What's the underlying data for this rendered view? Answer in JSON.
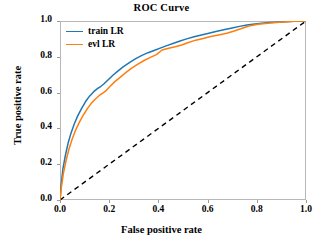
{
  "chart_data": {
    "type": "line",
    "title": "ROC Curve",
    "xlabel": "False positive rate",
    "ylabel": "True positive rate",
    "xlim": [
      0.0,
      1.0
    ],
    "ylim": [
      0.0,
      1.0
    ],
    "xticks": [
      "0.0",
      "0.2",
      "0.4",
      "0.6",
      "0.8",
      "1.0"
    ],
    "xtick_values": [
      0.0,
      0.2,
      0.4,
      0.6,
      0.8,
      1.0
    ],
    "yticks": [
      "0.0",
      "0.2",
      "0.4",
      "0.6",
      "0.8",
      "1.0"
    ],
    "ytick_values": [
      0.0,
      0.2,
      0.4,
      0.6,
      0.8,
      1.0
    ],
    "grid": false,
    "legend_position": "upper left",
    "series": [
      {
        "name": "train LR",
        "color": "#1f77b4",
        "style": "solid",
        "x": [
          0.0,
          0.005,
          0.012,
          0.022,
          0.033,
          0.045,
          0.058,
          0.072,
          0.088,
          0.104,
          0.12,
          0.137,
          0.152,
          0.165,
          0.178,
          0.196,
          0.215,
          0.235,
          0.258,
          0.282,
          0.308,
          0.333,
          0.358,
          0.385,
          0.41,
          0.437,
          0.462,
          0.488,
          0.515,
          0.545,
          0.575,
          0.605,
          0.638,
          0.67,
          0.7,
          0.73,
          0.76,
          0.8,
          0.85,
          0.9,
          0.95,
          1.0
        ],
        "y": [
          0.0,
          0.09,
          0.175,
          0.25,
          0.318,
          0.375,
          0.425,
          0.47,
          0.512,
          0.55,
          0.58,
          0.605,
          0.622,
          0.634,
          0.648,
          0.672,
          0.697,
          0.72,
          0.745,
          0.768,
          0.79,
          0.808,
          0.823,
          0.837,
          0.85,
          0.864,
          0.876,
          0.888,
          0.9,
          0.912,
          0.922,
          0.932,
          0.943,
          0.952,
          0.961,
          0.97,
          0.978,
          0.985,
          0.991,
          0.995,
          0.998,
          1.0
        ]
      },
      {
        "name": "evl LR",
        "color": "#ff7f0e",
        "style": "solid",
        "x": [
          0.0,
          0.006,
          0.014,
          0.025,
          0.037,
          0.05,
          0.064,
          0.079,
          0.095,
          0.112,
          0.128,
          0.145,
          0.16,
          0.172,
          0.185,
          0.203,
          0.222,
          0.243,
          0.266,
          0.29,
          0.315,
          0.34,
          0.365,
          0.392,
          0.415,
          0.442,
          0.468,
          0.495,
          0.522,
          0.552,
          0.582,
          0.612,
          0.645,
          0.678,
          0.708,
          0.738,
          0.768,
          0.805,
          0.855,
          0.905,
          0.952,
          1.0
        ],
        "y": [
          0.0,
          0.075,
          0.15,
          0.222,
          0.288,
          0.342,
          0.392,
          0.435,
          0.475,
          0.512,
          0.542,
          0.566,
          0.584,
          0.596,
          0.608,
          0.634,
          0.66,
          0.684,
          0.71,
          0.735,
          0.758,
          0.778,
          0.795,
          0.812,
          0.838,
          0.848,
          0.856,
          0.866,
          0.88,
          0.893,
          0.902,
          0.913,
          0.922,
          0.932,
          0.944,
          0.958,
          0.972,
          0.982,
          0.989,
          0.994,
          0.998,
          1.0
        ]
      },
      {
        "name": "chance",
        "color": "#000000",
        "style": "dashed",
        "x": [
          0.0,
          1.0
        ],
        "y": [
          0.0,
          1.0
        ]
      }
    ],
    "legend": [
      {
        "label": "train LR",
        "color": "#1f77b4"
      },
      {
        "label": "evl LR",
        "color": "#ff7f0e"
      }
    ]
  }
}
